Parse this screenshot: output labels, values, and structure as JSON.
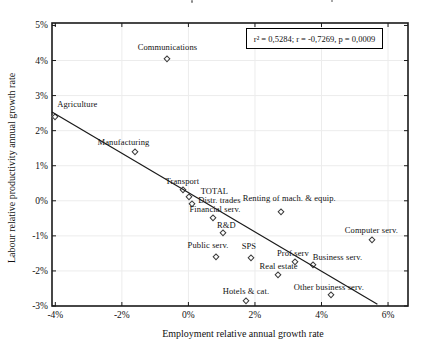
{
  "chart_data": {
    "type": "scatter",
    "annotation": "r² = 0,5284;  r = -0,7269, p = 0,0009",
    "xlabel": "Employment relative annual growth rate",
    "ylabel": "Labour relative productivity annual growth rate",
    "xlim": [
      -4.1,
      6.6
    ],
    "ylim": [
      -3.0,
      5.07
    ],
    "grid": true,
    "legend": "none",
    "x_ticks": {
      "values": [
        -4,
        -2,
        0,
        2,
        4,
        6
      ],
      "labels": [
        "-4%",
        "-2%",
        "0%",
        "2%",
        "4%",
        "6%"
      ]
    },
    "y_ticks": {
      "values": [
        5,
        4,
        3,
        2,
        1,
        0,
        -1,
        -2,
        -3
      ],
      "labels": [
        "5%",
        "4%",
        "3%",
        "2%",
        "1%",
        "0%",
        "-1%",
        "-2%",
        "-3%"
      ]
    },
    "x_gridlines": [
      -2,
      0,
      2,
      4,
      6
    ],
    "y_gridlines": [
      4,
      3,
      2,
      1,
      0,
      -1,
      -2
    ],
    "points": [
      {
        "label": "Agriculture",
        "x": -4.0,
        "y": 2.4,
        "dx": 22,
        "dy": -13
      },
      {
        "label": "Communications",
        "x": -0.63,
        "y": 4.05,
        "dx": 0,
        "dy": -12
      },
      {
        "label": "Manufacturing",
        "x": -1.62,
        "y": 1.4,
        "dx": -11,
        "dy": -10
      },
      {
        "label": "Transport",
        "x": -0.15,
        "y": 0.3,
        "dx": -1,
        "dy": -9
      },
      {
        "label": "TOTAL",
        "x": 0.03,
        "y": 0.1,
        "dx": 25,
        "dy": -6
      },
      {
        "label": "Distr. trades",
        "x": 0.12,
        "y": -0.1,
        "dx": 27,
        "dy": -4
      },
      {
        "label": "Financial serv.",
        "x": 0.74,
        "y": -0.5,
        "dx": 2,
        "dy": -9
      },
      {
        "label": "R&D",
        "x": 1.05,
        "y": -0.93,
        "dx": 3,
        "dy": -8
      },
      {
        "label": "Public serv.",
        "x": 0.83,
        "y": -1.6,
        "dx": -8,
        "dy": -12
      },
      {
        "label": "SPS",
        "x": 1.88,
        "y": -1.62,
        "dx": -2,
        "dy": -12
      },
      {
        "label": "Renting of mach. & equip.",
        "x": 2.79,
        "y": -0.31,
        "dx": 8,
        "dy": -14
      },
      {
        "label": "Computer serv.",
        "x": 5.53,
        "y": -1.12,
        "dx": -1,
        "dy": -10
      },
      {
        "label": "Prof.serv",
        "x": 3.2,
        "y": -1.74,
        "dx": -2,
        "dy": -9
      },
      {
        "label": "Business serv.",
        "x": 3.73,
        "y": -1.83,
        "dx": 25,
        "dy": -8
      },
      {
        "label": "Real estate",
        "x": 2.68,
        "y": -2.12,
        "dx": 1,
        "dy": -9
      },
      {
        "label": "Other business serv.",
        "x": 4.28,
        "y": -2.68,
        "dx": -2,
        "dy": -8
      },
      {
        "label": "Hotels & cat.",
        "x": 1.73,
        "y": -2.87,
        "dx": 0,
        "dy": -10
      }
    ],
    "trendline": {
      "x1": -4.1,
      "y1": 2.53,
      "x2": 5.68,
      "y2": -2.95
    }
  },
  "colors": {
    "background": "#ffffff",
    "frame": "#1a1a1a",
    "grid": "#ececec",
    "marker": "#3c3c3c",
    "trendline": "#1a1a1a",
    "text": "#111111"
  }
}
